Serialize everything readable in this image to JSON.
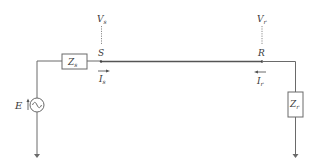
{
  "diagram": {
    "type": "single-line transmission circuit",
    "source": {
      "label": "E",
      "symbol": "ac-source"
    },
    "sending_impedance": {
      "label": "Z",
      "subscript": "s"
    },
    "receiving_impedance": {
      "label": "Z",
      "subscript": "r"
    },
    "sending_node": {
      "label": "S"
    },
    "receiving_node": {
      "label": "R"
    },
    "sending_voltage": {
      "label": "V",
      "subscript": "s"
    },
    "receiving_voltage": {
      "label": "V",
      "subscript": "r"
    },
    "sending_current": {
      "label": "I",
      "subscript": "s",
      "direction": "right"
    },
    "receiving_current": {
      "label": "I",
      "subscript": "r",
      "direction": "left"
    },
    "colors": {
      "wire": "#6a6a6a",
      "line": "#555555",
      "text": "#3a3a3a"
    }
  }
}
